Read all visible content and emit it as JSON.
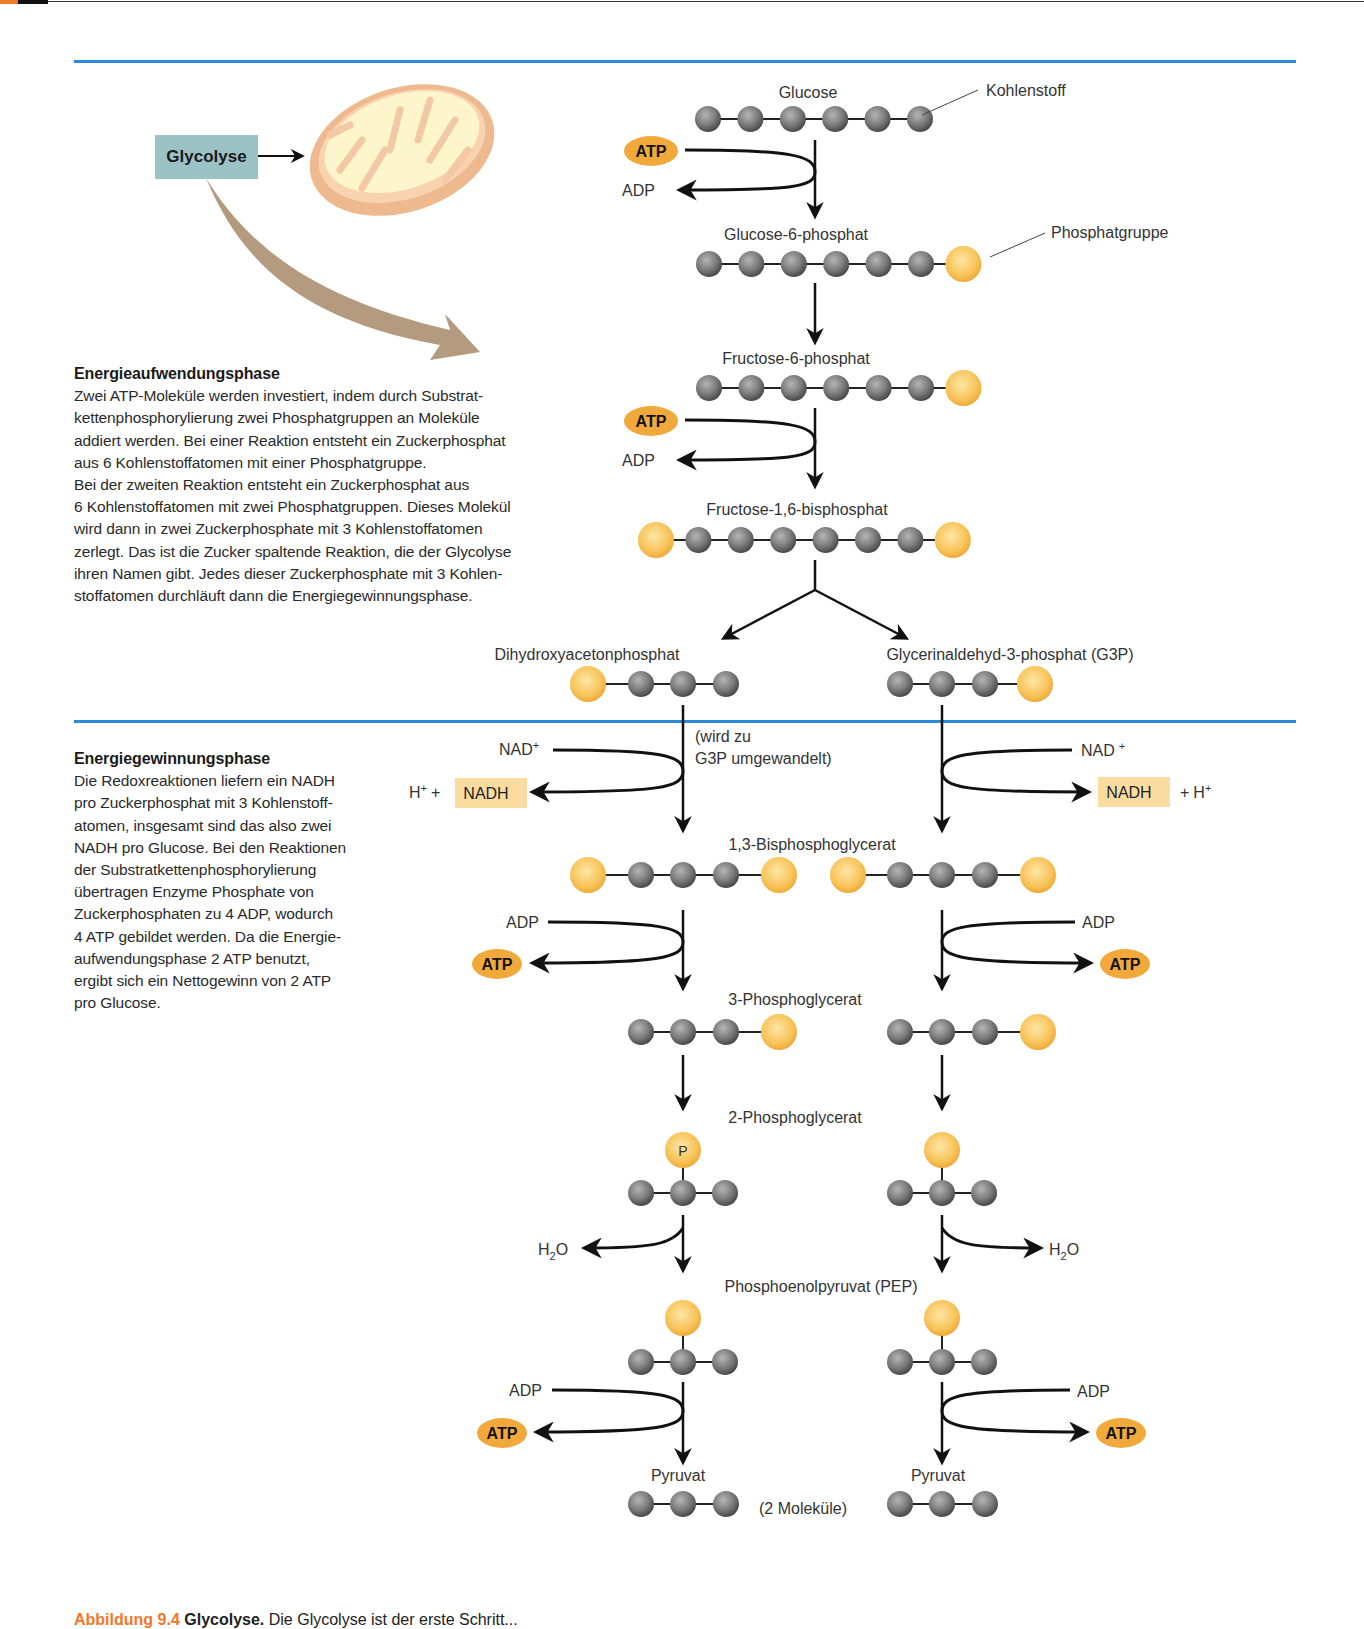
{
  "header": {
    "accent_color": "#f0782a",
    "rule_color": "#2b8ad8"
  },
  "overview": {
    "glycolysis_label": "Glycolyse",
    "organelle": "mitochondrion"
  },
  "phase1": {
    "heading": "Energieaufwendungsphase",
    "lines": [
      "Zwei ATP-Moleküle werden investiert, indem durch Substrat-",
      "kettenphosphorylierung zwei Phosphatgruppen an Moleküle",
      "addiert werden. Bei einer Reaktion entsteht ein Zuckerphosphat",
      "aus 6 Kohlenstoffatomen mit einer Phosphatgruppe.",
      "Bei der zweiten Reaktion entsteht  ein Zuckerphosphat aus",
      "6 Kohlenstoffatomen mit zwei Phosphatgruppen. Dieses Molekül",
      "wird dann in zwei Zuckerphosphate mit 3 Kohlenstoffatomen",
      "zerlegt. Das ist die Zucker spaltende Reaktion, die der Glycolyse",
      "ihren Namen gibt. Jedes dieser Zuckerphosphate mit 3 Kohlen-",
      "stoffatomen durchläuft dann die Energiegewinnungsphase."
    ]
  },
  "phase2": {
    "heading": "Energiegewinnungsphase",
    "lines": [
      "Die Redoxreaktionen liefern ein NADH",
      "pro Zuckerphosphat mit 3 Kohlenstoff-",
      "atomen, insgesamt sind das also zwei",
      "NADH pro Glucose. Bei den Reaktionen",
      "der Substratkettenphosphorylierung",
      "übertragen Enzyme Phosphate von",
      "Zuckerphosphaten zu 4 ADP, wodurch",
      "4 ATP gebildet werden. Da die Energie-",
      "aufwendungsphase 2 ATP benutzt,",
      "ergibt sich ein Nettogewinn von 2 ATP",
      "pro Glucose."
    ]
  },
  "legend": {
    "carbon": "Kohlenstoff",
    "phosphate": "Phosphatgruppe"
  },
  "molecules": {
    "glucose": "Glucose",
    "g6p": "Glucose-6-phosphat",
    "f6p": "Fructose-6-phosphat",
    "f16bp": "Fructose-1,6-bisphosphat",
    "dhap": "Dihydroxyacetonphosphat",
    "g3p": "Glycerinaldehyd-3-phosphat (G3P)",
    "dhap_note_1": "(wird zu",
    "dhap_note_2": "G3P umgewandelt)",
    "bpg13": "1,3-Bisphosphoglycerat",
    "pg3": "3-Phosphoglycerat",
    "pg2": "2-Phosphoglycerat",
    "pep": "Phosphoenolpyruvat (PEP)",
    "pyruvate": "Pyruvat",
    "pyruvate_note": "(2 Moleküle)",
    "phosphate_symbol": "P"
  },
  "cofactors": {
    "atp": "ATP",
    "adp": "ADP",
    "nad": "NAD",
    "nadh": "NADH",
    "plus_sup": "+",
    "h": "H",
    "plus": "+",
    "h2o_h": "H",
    "h2o_2": "2",
    "h2o_o": "O"
  },
  "colors": {
    "carbon": "#7b7b7b",
    "phosphate": "#f8c45a",
    "atp_badge": "#f2a93b",
    "nadh_box": "#fbdca0",
    "glycolyse_box": "#9bc3c6",
    "curved_arrow": "#b49a7e"
  },
  "caption": {
    "figure": "Abbildung 9.4",
    "title": "Glycolyse.",
    "text": "Die Glycolyse ist der erste Schritt..."
  }
}
